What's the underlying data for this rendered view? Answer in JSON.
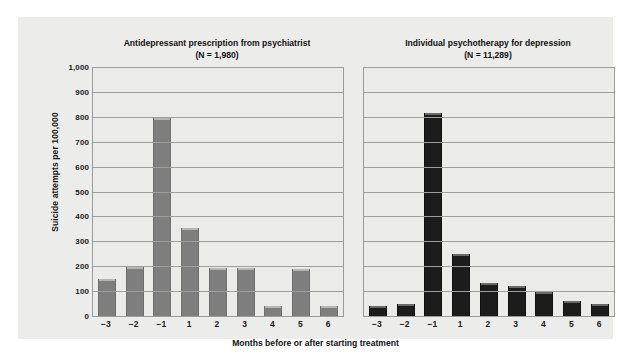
{
  "chart_data": {
    "type": "bar",
    "title": "",
    "xlabel": "Months before or after starting treatment",
    "ylabel": "Suicide attempts per 100,000",
    "ylim": [
      0,
      1000
    ],
    "ytick_step": 100,
    "ytick_labels": [
      "1,000",
      "900",
      "800",
      "700",
      "600",
      "500",
      "400",
      "300",
      "200",
      "100",
      "0"
    ],
    "ytick_values": [
      1000,
      900,
      800,
      700,
      600,
      500,
      400,
      300,
      200,
      100,
      0
    ],
    "grid": true,
    "legend": "none",
    "categories": [
      "−3",
      "−2",
      "−1",
      "1",
      "2",
      "3",
      "4",
      "5",
      "6"
    ],
    "panels": [
      {
        "key": "antidepressant",
        "title_line1": "Antidepressant prescription from psychiatrist",
        "title_line2": "(N = 1,980)",
        "sample_size": "N = 1,980",
        "bar_color": "#7e7e7e",
        "values": [
          150,
          195,
          795,
          352,
          193,
          193,
          42,
          190,
          42
        ]
      },
      {
        "key": "psychotherapy",
        "title_line1": "Individual psychotherapy for depression",
        "title_line2": "(N = 11,289)",
        "sample_size": "N = 11,289",
        "bar_color": "#1c1c1c",
        "values": [
          40,
          48,
          815,
          248,
          133,
          120,
          95,
          60,
          47
        ]
      }
    ]
  },
  "colors": {
    "figure_background": "#ffffff",
    "panel_background": "#ececeb",
    "plot_background": "#ebebe9",
    "gridline": "#9e9e9c",
    "axis_border": "#9a9a98",
    "text": "#111111"
  }
}
